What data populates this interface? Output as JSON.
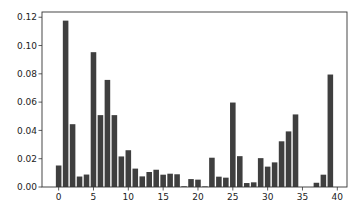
{
  "chart_data": {
    "type": "bar",
    "title": "",
    "xlabel": "",
    "ylabel": "",
    "bar_color": "#3f3f3f",
    "grid": false,
    "legend": null,
    "xlim": [
      -2.39,
      41.39
    ],
    "ylim": [
      0,
      0.1237
    ],
    "xticks": [
      0,
      5,
      10,
      15,
      20,
      25,
      30,
      35,
      40
    ],
    "xtick_labels": [
      "0",
      "5",
      "10",
      "15",
      "20",
      "25",
      "30",
      "35",
      "40"
    ],
    "yticks": [
      0,
      0.02,
      0.04,
      0.06,
      0.08,
      0.1,
      0.12
    ],
    "ytick_labels": [
      "0.00",
      "0.02",
      "0.04",
      "0.06",
      "0.08",
      "0.10",
      "0.12"
    ],
    "categories": [
      0,
      1,
      2,
      3,
      4,
      5,
      6,
      7,
      8,
      9,
      10,
      11,
      12,
      13,
      14,
      15,
      16,
      17,
      18,
      19,
      20,
      21,
      22,
      23,
      24,
      25,
      26,
      27,
      28,
      29,
      30,
      31,
      32,
      33,
      34,
      35,
      36,
      37,
      38,
      39
    ],
    "values": [
      0.0152,
      0.1176,
      0.0444,
      0.0074,
      0.0088,
      0.0953,
      0.0508,
      0.0757,
      0.0508,
      0.0216,
      0.026,
      0.013,
      0.0075,
      0.0106,
      0.0122,
      0.0087,
      0.0094,
      0.009,
      0.0005,
      0.0056,
      0.0052,
      0.0004,
      0.0207,
      0.0073,
      0.0066,
      0.0597,
      0.0218,
      0.0028,
      0.0033,
      0.0204,
      0.0144,
      0.0174,
      0.0323,
      0.0393,
      0.0513,
      0.0,
      0.0,
      0.003,
      0.0087,
      0.0795
    ]
  }
}
